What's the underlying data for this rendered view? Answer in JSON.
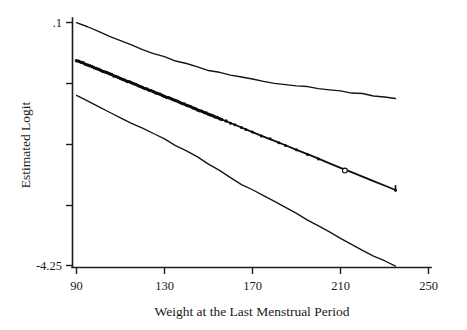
{
  "chart_data": {
    "type": "line",
    "title": "",
    "xlabel": "Weight at the Last Menstrual Period",
    "ylabel": "Estimated Logit",
    "xlim": [
      90,
      250
    ],
    "ylim": [
      -4.25,
      0.1
    ],
    "grid": false,
    "legend": "none",
    "xticks": [
      90,
      130,
      170,
      210,
      250
    ],
    "xticklabels": [
      "90",
      "130",
      "170",
      "210",
      "250"
    ],
    "yticks": [
      0.1,
      -0.9875,
      -2.075,
      -3.1625,
      -4.25
    ],
    "yticklabels": [
      ".1",
      "",
      "",
      "",
      "-4.25"
    ],
    "ytick_label_top": ".1",
    "ytick_label_bottom": "-4.25",
    "series": [
      {
        "name": "upper-confidence-band",
        "style": "thin-line",
        "x": [
          90,
          95,
          100,
          105,
          110,
          115,
          120,
          125,
          130,
          135,
          140,
          145,
          150,
          155,
          160,
          165,
          170,
          175,
          180,
          185,
          190,
          195,
          200,
          205,
          210,
          215,
          220,
          225,
          230,
          235
        ],
        "y": [
          0.1,
          0.02,
          -0.06,
          -0.14,
          -0.22,
          -0.3,
          -0.38,
          -0.45,
          -0.52,
          -0.58,
          -0.64,
          -0.7,
          -0.75,
          -0.8,
          -0.845,
          -0.885,
          -0.92,
          -0.95,
          -0.98,
          -1.005,
          -1.03,
          -1.055,
          -1.08,
          -1.105,
          -1.13,
          -1.155,
          -1.18,
          -1.21,
          -1.24,
          -1.27
        ]
      },
      {
        "name": "fitted-logit",
        "style": "thick-line-with-points",
        "x": [
          90,
          95,
          100,
          105,
          110,
          115,
          120,
          125,
          130,
          135,
          140,
          145,
          150,
          155,
          160,
          165,
          170,
          175,
          180,
          185,
          190,
          195,
          200,
          205,
          210,
          215,
          220,
          225,
          230,
          235
        ],
        "y": [
          -0.58,
          -0.66,
          -0.74,
          -0.82,
          -0.9,
          -0.98,
          -1.06,
          -1.14,
          -1.22,
          -1.3,
          -1.38,
          -1.46,
          -1.54,
          -1.62,
          -1.7,
          -1.78,
          -1.86,
          -1.94,
          -2.02,
          -2.1,
          -2.18,
          -2.26,
          -2.34,
          -2.42,
          -2.5,
          -2.58,
          -2.66,
          -2.74,
          -2.82,
          -2.9
        ]
      },
      {
        "name": "lower-confidence-band",
        "style": "thin-line",
        "x": [
          90,
          95,
          100,
          105,
          110,
          115,
          120,
          125,
          130,
          135,
          140,
          145,
          150,
          155,
          160,
          165,
          170,
          175,
          180,
          185,
          190,
          195,
          200,
          205,
          210,
          215,
          220,
          225,
          230,
          235
        ],
        "y": [
          -1.2,
          -1.3,
          -1.4,
          -1.5,
          -1.6,
          -1.7,
          -1.8,
          -1.89,
          -1.99,
          -2.1,
          -2.2,
          -2.31,
          -2.43,
          -2.55,
          -2.67,
          -2.8,
          -2.9,
          -3.0,
          -3.1,
          -3.21,
          -3.32,
          -3.43,
          -3.54,
          -3.65,
          -3.76,
          -3.87,
          -3.98,
          -4.08,
          -4.17,
          -4.27
        ]
      }
    ],
    "observations_note": "dense filled markers along fitted line from 90 to ~200, sparse beyond",
    "open_marker": {
      "x": 212,
      "y": -2.55,
      "style": "open-circle"
    },
    "marker_x_values": [
      90,
      91,
      92,
      93,
      94,
      95,
      96,
      97,
      98,
      99,
      100,
      101,
      102,
      103,
      104,
      105,
      106,
      107,
      108,
      109,
      110,
      111,
      112,
      113,
      114,
      115,
      116,
      117,
      118,
      119,
      120,
      121,
      122,
      123,
      124,
      125,
      126,
      127,
      128,
      129,
      130,
      131,
      132,
      133,
      134,
      135,
      136,
      137,
      138,
      139,
      140,
      141,
      142,
      143,
      144,
      145,
      146,
      147,
      148,
      149,
      150,
      151,
      152,
      153,
      154,
      155,
      156,
      158,
      160,
      162,
      165,
      167,
      170,
      174,
      178,
      182,
      185,
      190,
      195,
      200,
      212,
      235
    ]
  },
  "axes": {
    "x_title": "Weight at the Last Menstrual Period",
    "y_title": "Estimated Logit"
  },
  "figure": {
    "background_color": "#ffffff",
    "line_color": "#0d0d0d"
  }
}
